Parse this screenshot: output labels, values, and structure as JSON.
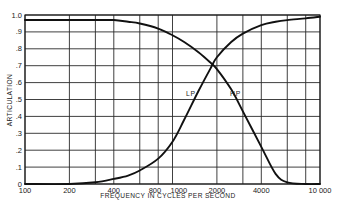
{
  "chart_data": {
    "type": "line",
    "title": "",
    "xlabel": "FREQUENCY IN CYCLES PER SECOND",
    "ylabel": "ARTICULATION",
    "xscale": "log",
    "xlim": [
      100,
      10000
    ],
    "ylim": [
      0,
      1.0
    ],
    "grid": true,
    "legend": "inline labels near crossover",
    "x_tick_labels": [
      {
        "value": 100,
        "label": "100"
      },
      {
        "value": 200,
        "label": "200"
      },
      {
        "value": 400,
        "label": "400"
      },
      {
        "value": 800,
        "label": "800"
      },
      {
        "value": 1000,
        "label": "1000"
      },
      {
        "value": 2000,
        "label": "2000"
      },
      {
        "value": 4000,
        "label": "4000"
      },
      {
        "value": 10000,
        "label": "10 000"
      }
    ],
    "x_grid_values": [
      100,
      200,
      300,
      400,
      600,
      800,
      1000,
      2000,
      3000,
      4000,
      6000,
      8000,
      10000
    ],
    "y_tick_labels": [
      {
        "value": 0,
        "label": "0"
      },
      {
        "value": 0.1,
        "label": ".1"
      },
      {
        "value": 0.2,
        "label": ".2"
      },
      {
        "value": 0.3,
        "label": ".3"
      },
      {
        "value": 0.4,
        "label": ".4"
      },
      {
        "value": 0.5,
        "label": ".5"
      },
      {
        "value": 0.6,
        "label": ".6"
      },
      {
        "value": 0.7,
        "label": ".7"
      },
      {
        "value": 0.8,
        "label": ".8"
      },
      {
        "value": 0.9,
        "label": ".9"
      },
      {
        "value": 1.0,
        "label": "1.0"
      }
    ],
    "series": [
      {
        "name": "LP",
        "label": "LP",
        "description": "Low-pass filtered speech: articulation vs cutoff frequency",
        "x": [
          100,
          200,
          300,
          400,
          500,
          600,
          800,
          1000,
          1200,
          1500,
          1800,
          2000,
          2500,
          3000,
          4000,
          5000,
          6000,
          8000,
          10000
        ],
        "y": [
          0.97,
          0.97,
          0.97,
          0.97,
          0.96,
          0.95,
          0.92,
          0.88,
          0.84,
          0.78,
          0.72,
          0.68,
          0.56,
          0.43,
          0.22,
          0.06,
          0.01,
          0.0,
          0.0
        ]
      },
      {
        "name": "HP",
        "label": "HP",
        "description": "High-pass filtered speech: articulation vs cutoff frequency",
        "x": [
          100,
          200,
          300,
          400,
          500,
          600,
          800,
          1000,
          1200,
          1500,
          1800,
          2000,
          2500,
          3000,
          4000,
          5000,
          6000,
          8000,
          10000
        ],
        "y": [
          0.0,
          0.0,
          0.01,
          0.03,
          0.05,
          0.08,
          0.15,
          0.25,
          0.38,
          0.55,
          0.68,
          0.75,
          0.84,
          0.89,
          0.94,
          0.96,
          0.97,
          0.98,
          0.99
        ]
      }
    ]
  }
}
